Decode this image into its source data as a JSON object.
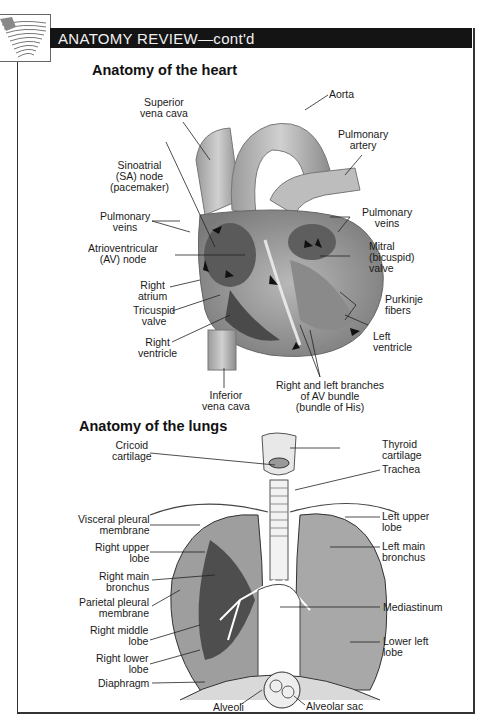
{
  "header": {
    "title": "ANATOMY REVIEW—cont'd"
  },
  "heart": {
    "title": "Anatomy of the heart",
    "labels": {
      "superior_vena_cava": [
        "Superior",
        "vena cava"
      ],
      "aorta": [
        "Aorta"
      ],
      "pulmonary_artery": [
        "Pulmonary",
        "artery"
      ],
      "sa_node": [
        "Sinoatrial",
        "(SA) node",
        "(pacemaker)"
      ],
      "pulmonary_veins_left": [
        "Pulmonary",
        "veins"
      ],
      "pulmonary_veins_right": [
        "Pulmonary",
        "veins"
      ],
      "av_node": [
        "Atrioventricular",
        "(AV) node"
      ],
      "mitral_valve": [
        "Mitral",
        "(bicuspid)",
        "valve"
      ],
      "right_atrium": [
        "Right",
        "atrium"
      ],
      "purkinje_fibers": [
        "Purkinje",
        "fibers"
      ],
      "tricuspid_valve": [
        "Tricuspid",
        "valve"
      ],
      "left_ventricle": [
        "Left",
        "ventricle"
      ],
      "right_ventricle": [
        "Right",
        "ventricle"
      ],
      "inferior_vena_cava": [
        "Inferior",
        "vena cava"
      ],
      "av_bundle": [
        "Right and left branches",
        "of AV bundle",
        "(bundle of His)"
      ]
    }
  },
  "lungs": {
    "title": "Anatomy of the lungs",
    "labels": {
      "cricoid_cartilage": [
        "Cricoid",
        "cartilage"
      ],
      "thyroid_cartilage": [
        "Thyroid",
        "cartilage"
      ],
      "trachea": [
        "Trachea"
      ],
      "visceral_pleural_membrane": [
        "Visceral pleural",
        "membrane"
      ],
      "left_upper_lobe": [
        "Left upper",
        "lobe"
      ],
      "right_upper_lobe": [
        "Right upper",
        "lobe"
      ],
      "left_main_bronchus": [
        "Left main",
        "bronchus"
      ],
      "right_main_bronchus": [
        "Right main",
        "bronchus"
      ],
      "parietal_pleural_membrane": [
        "Parietal pleural",
        "membrane"
      ],
      "mediastinum": [
        "Mediastinum"
      ],
      "right_middle_lobe": [
        "Right middle",
        "lobe"
      ],
      "right_lower_lobe": [
        "Right lower",
        "lobe"
      ],
      "lower_left_lobe": [
        "Lower left",
        "lobe"
      ],
      "diaphragm": [
        "Diaphragm"
      ],
      "alveoli": [
        "Alveoli"
      ],
      "alveolar_sac": [
        "Alveolar sac"
      ]
    }
  },
  "colors": {
    "header_bg": "#141414",
    "header_text": "#f0f0f0",
    "frame": "#333333"
  }
}
